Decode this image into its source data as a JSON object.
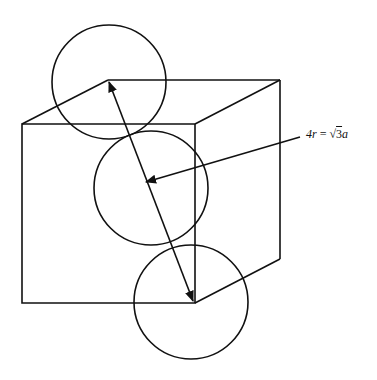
{
  "diagram": {
    "annotation": {
      "label": "4r = √3a",
      "lhs": "4r",
      "eq": "=",
      "sqrt": "√",
      "rhs_num": "3",
      "rhs_var": "a"
    },
    "stroke_color": "#111111",
    "background": "#ffffff"
  }
}
